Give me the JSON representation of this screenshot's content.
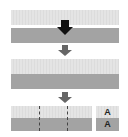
{
  "diagram": {
    "steps": [
      {
        "name": "step-1",
        "rows": [
          "light",
          "dark"
        ]
      },
      {
        "name": "step-2",
        "rows": [
          "light",
          "dark"
        ]
      },
      {
        "name": "step-3",
        "rows": [
          "light",
          "dark"
        ],
        "divisions": 3
      }
    ],
    "side_boxes": [
      {
        "label": "A"
      },
      {
        "label": "A"
      }
    ],
    "colors": {
      "light": "#e2e2e2",
      "dark": "#a3a3a3",
      "arrow_black": "#111111",
      "arrow_gray": "#666666"
    }
  }
}
